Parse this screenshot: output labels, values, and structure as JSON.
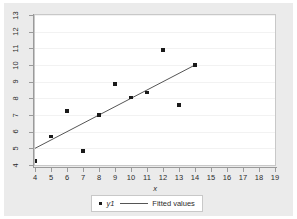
{
  "chart_data": {
    "type": "scatter",
    "title": "",
    "xlabel": "x",
    "ylabel": "",
    "xlim": [
      4,
      19
    ],
    "ylim": [
      4,
      13
    ],
    "xticks": [
      4,
      5,
      6,
      7,
      8,
      9,
      10,
      11,
      12,
      13,
      14,
      15,
      16,
      17,
      18,
      19
    ],
    "yticks": [
      4,
      5,
      6,
      7,
      8,
      9,
      10,
      11,
      12,
      13
    ],
    "grid": "horizontal",
    "legend_position": "bottom",
    "series": [
      {
        "name": "y1",
        "type": "scatter",
        "marker": "square",
        "color": "#1a1a1a",
        "x": [
          4,
          5,
          6,
          7,
          8,
          9,
          10,
          11,
          12,
          13,
          14
        ],
        "y": [
          4.25,
          5.7,
          7.25,
          4.85,
          7.0,
          8.85,
          8.05,
          8.35,
          10.9,
          7.6,
          10.0
        ]
      },
      {
        "name": "Fitted values",
        "type": "line",
        "color": "#555555",
        "x": [
          4,
          14
        ],
        "y": [
          5.0,
          10.0
        ],
        "slope": 0.5,
        "intercept": 3.0
      }
    ]
  },
  "axes": {
    "x_title": "x",
    "x_tick_labels": [
      "4",
      "5",
      "6",
      "7",
      "8",
      "9",
      "10",
      "11",
      "12",
      "13",
      "14",
      "15",
      "16",
      "17",
      "18",
      "19"
    ],
    "y_tick_labels": [
      "4",
      "5",
      "6",
      "7",
      "8",
      "9",
      "10",
      "11",
      "12",
      "13"
    ]
  },
  "legend": {
    "entries": [
      {
        "label": "y1",
        "kind": "marker"
      },
      {
        "label": "Fitted values",
        "kind": "line"
      }
    ]
  },
  "colors": {
    "canvas_background": "#ebebeb",
    "plot_background": "#ffffff",
    "marker": "#1a1a1a",
    "fit_line": "#555555",
    "axis": "#9a9a9a",
    "gridline": "#f2f2f2",
    "text": "#2b2b2b"
  }
}
